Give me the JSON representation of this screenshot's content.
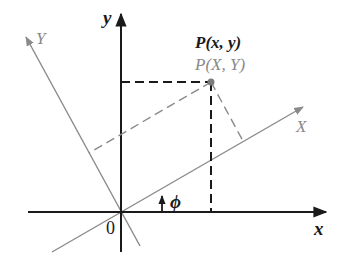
{
  "diagram": {
    "colors": {
      "original_axes": "#1a1a1a",
      "rotated_axes": "#8a8a8a",
      "point": "#7a7a7a"
    },
    "labels": {
      "x_axis": "x",
      "y_axis": "y",
      "X_axis": "X",
      "Y_axis": "Y",
      "origin": "0",
      "angle": "ϕ",
      "point_xy": "P(x, y)",
      "point_XY": "P(X, Y)"
    },
    "geometry": {
      "origin": [
        121,
        212
      ],
      "point": [
        211,
        82
      ],
      "rotation_angle_deg": 28
    }
  }
}
